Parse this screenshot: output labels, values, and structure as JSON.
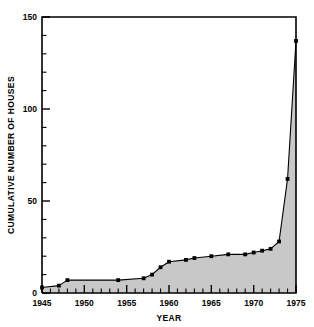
{
  "chart_data": {
    "type": "area",
    "title": "",
    "xlabel": "YEAR",
    "ylabel": "CUMULATIVE NUMBER OF HOUSES",
    "xlim": [
      1945,
      1975
    ],
    "ylim": [
      0,
      150
    ],
    "grid": false,
    "legend": false,
    "fill_color": "#c8c8c8",
    "line_color": "#000000",
    "marker_color": "#000000",
    "marker": "square",
    "x_major_ticks": [
      1945,
      1950,
      1955,
      1960,
      1965,
      1970,
      1975
    ],
    "x_tick_labels": [
      "1945",
      "1950",
      "1955",
      "1960",
      "1965",
      "1970",
      "1975"
    ],
    "x_minor_step": 1,
    "y_major_ticks": [
      0,
      50,
      100,
      150
    ],
    "y_tick_labels": [
      "0",
      "50",
      "100",
      "150"
    ],
    "y_minor_step": 10,
    "x": [
      1945,
      1947,
      1948,
      1954,
      1957,
      1958,
      1959,
      1960,
      1962,
      1963,
      1965,
      1967,
      1969,
      1970,
      1971,
      1972,
      1973,
      1974,
      1975
    ],
    "values": [
      3,
      4,
      7,
      7,
      8,
      10,
      14,
      17,
      18,
      19,
      20,
      21,
      21,
      22,
      23,
      24,
      28,
      62,
      137
    ],
    "series": [
      {
        "name": "Cumulative number of houses",
        "values": [
          3,
          4,
          7,
          7,
          8,
          10,
          14,
          17,
          18,
          19,
          20,
          21,
          21,
          22,
          23,
          24,
          28,
          62,
          137
        ]
      }
    ]
  }
}
